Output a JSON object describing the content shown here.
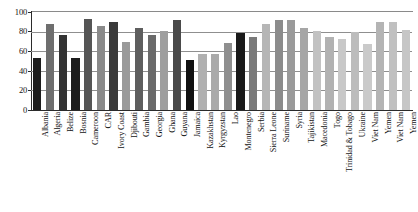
{
  "chart_data": {
    "type": "bar",
    "title": "",
    "subtitle": "",
    "xlabel": "",
    "ylabel": "",
    "ylim": [
      0,
      100
    ],
    "yticks": [
      0,
      20,
      40,
      60,
      80,
      100
    ],
    "grid": true,
    "legend": "none",
    "categories": [
      "Albania",
      "Algeria",
      "Belize",
      "Bosnia",
      "Cameroon",
      "CAR",
      "Ivory Coast",
      "Djibouti",
      "Gambia",
      "Georgia",
      "Ghana",
      "Guyana",
      "Jamaica",
      "Kazakhstan",
      "Kyrgyzstan",
      "Lao",
      "Montenegro",
      "Serbia",
      "Sierra Leone",
      "Suriname",
      "Syria",
      "Tajikistan",
      "Macedonia",
      "Togo",
      "Trinidad & Tobago",
      "Ukraine",
      "Viet Nam",
      "Yemen",
      "Viet Nam",
      "Yemen"
    ],
    "values": [
      53,
      88,
      77,
      53,
      93,
      86,
      90,
      69,
      84,
      77,
      81,
      92,
      51,
      57,
      57,
      68,
      79,
      74,
      88,
      92,
      92,
      84,
      81,
      75,
      72,
      80,
      67,
      90,
      90,
      82
    ],
    "bar_colors": [
      "#1c1c1c",
      "#6e6e6e",
      "#333333",
      "#1c1c1c",
      "#555555",
      "#8a8a8a",
      "#3a3a3a",
      "#9a9a9a",
      "#5e5e5e",
      "#6a6a6a",
      "#9e9e9e",
      "#4a4a4a",
      "#111111",
      "#b0b0b0",
      "#aaaaaa",
      "#8f8f8f",
      "#1a1a1a",
      "#7a7a7a",
      "#b6b6b6",
      "#8c8c8c",
      "#9a9a9a",
      "#a6a6a6",
      "#c2c2c2",
      "#b2b2b2",
      "#c8c8c8",
      "#bcbcbc",
      "#cacaca",
      "#b4b4b4",
      "#c0c0c0",
      "#c6c6c6"
    ],
    "n_categories": 30,
    "axis_color": "#2b2b2b",
    "grid_color": "#8f8f8f",
    "background": "#ffffff"
  }
}
